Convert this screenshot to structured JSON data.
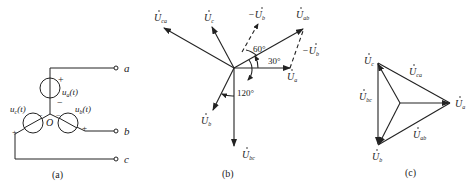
{
  "figure_a": {
    "caption": "(a)",
    "terminals": [
      "a",
      "b",
      "c"
    ],
    "node": "O",
    "sources": [
      {
        "name": "u_a(t)",
        "main": "u",
        "sub": "a",
        "arg": "(t)",
        "plus": "+",
        "minus": "−"
      },
      {
        "name": "u_b(t)",
        "main": "u",
        "sub": "b",
        "arg": "(t)",
        "plus": "+",
        "minus": "−"
      },
      {
        "name": "u_c(t)",
        "main": "u",
        "sub": "c",
        "arg": "(t)",
        "plus": "+",
        "minus": "−"
      }
    ]
  },
  "figure_b": {
    "caption": "(b)",
    "phasors": [
      {
        "main": "U",
        "sub": "ca"
      },
      {
        "main": "U",
        "sub": "c"
      },
      {
        "main": "−U",
        "sub": "b"
      },
      {
        "main": "U",
        "sub": "ab"
      },
      {
        "main": "−U",
        "sub": "b"
      },
      {
        "main": "U",
        "sub": "a"
      },
      {
        "main": "U",
        "sub": "b"
      },
      {
        "main": "U",
        "sub": "bc"
      }
    ],
    "angles": [
      "60°",
      "30°",
      "120°"
    ]
  },
  "figure_c": {
    "caption": "(c)",
    "phasors": [
      {
        "main": "U",
        "sub": "c"
      },
      {
        "main": "U",
        "sub": "ca"
      },
      {
        "main": "U",
        "sub": "bc"
      },
      {
        "main": "U",
        "sub": "a"
      },
      {
        "main": "U",
        "sub": "ab"
      },
      {
        "main": "U",
        "sub": "b"
      }
    ]
  }
}
